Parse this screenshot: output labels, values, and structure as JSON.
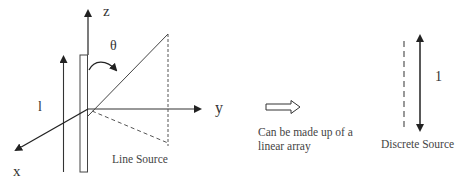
{
  "diagram": {
    "left_panel": {
      "axes": {
        "z_label": "z",
        "y_label": "y",
        "x_label": "x"
      },
      "angle_label": "θ",
      "length_label": "l",
      "caption": "Line Source"
    },
    "middle": {
      "arrow": "hollow-right-arrow",
      "caption_line1": "Can be made up of a",
      "caption_line2": "linear array"
    },
    "right_panel": {
      "length_label": "1",
      "caption": "Discrete Source"
    }
  }
}
